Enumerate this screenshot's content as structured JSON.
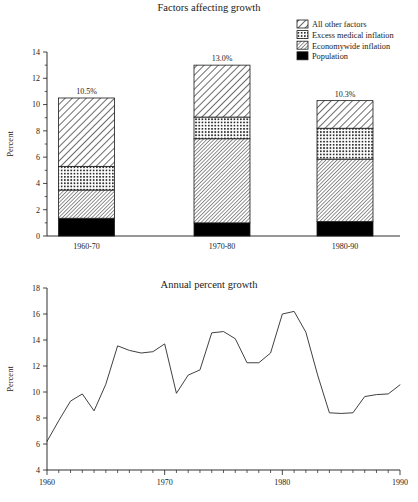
{
  "chart_data": [
    {
      "type": "bar",
      "id": "factors-affecting-growth",
      "title": "Factors affecting growth",
      "xlabel": "",
      "ylabel": "Percent",
      "ylim": [
        0,
        14
      ],
      "yticks": [
        0,
        2,
        4,
        6,
        8,
        10,
        12,
        14
      ],
      "yticklabels": [
        "0",
        "2",
        "4",
        "6",
        "8",
        "10",
        "12",
        "14"
      ],
      "minor_yticks": [
        1,
        3,
        5,
        7,
        9,
        11,
        13
      ],
      "grid": false,
      "stacked": true,
      "legend_position": "top-right",
      "categories": [
        "1960-70",
        "1970-80",
        "1980-90"
      ],
      "totals": [
        10.5,
        13.0,
        10.3
      ],
      "total_labels": [
        "10.5%",
        "13.0%",
        "10.3%"
      ],
      "series": [
        {
          "name": "Population",
          "pattern": "solid-black",
          "values": [
            1.35,
            1.0,
            1.1
          ]
        },
        {
          "name": "Economywide inflation",
          "pattern": "diagonal-fine-right",
          "values": [
            2.15,
            6.4,
            4.75
          ]
        },
        {
          "name": "Excess medical inflation",
          "pattern": "crosshatch-grid",
          "values": [
            1.8,
            1.65,
            2.35
          ]
        },
        {
          "name": "All other factors",
          "pattern": "diagonal-coarse-right",
          "values": [
            5.2,
            3.95,
            2.1
          ]
        }
      ],
      "legend_order": [
        "All other factors",
        "Excess medical inflation",
        "Economywide inflation",
        "Population"
      ]
    },
    {
      "type": "line",
      "id": "annual-percent-growth",
      "title": "Annual percent growth",
      "xlabel": "",
      "ylabel": "Percent",
      "ylim": [
        4,
        18
      ],
      "yticks": [
        4,
        6,
        8,
        10,
        12,
        14,
        16,
        18
      ],
      "yticklabels": [
        "4",
        "6",
        "8",
        "10",
        "12",
        "14",
        "16",
        "18"
      ],
      "xlim": [
        1960,
        1990
      ],
      "xticks": [
        1960,
        1970,
        1980,
        1990
      ],
      "xticklabels": [
        "1960",
        "1970",
        "1980",
        "1990"
      ],
      "minor_xtick_step": 1,
      "grid": false,
      "x": [
        1960,
        1961,
        1962,
        1963,
        1964,
        1965,
        1966,
        1967,
        1968,
        1969,
        1970,
        1971,
        1972,
        1973,
        1974,
        1975,
        1976,
        1977,
        1978,
        1979,
        1980,
        1981,
        1982,
        1983,
        1984,
        1985,
        1986,
        1987,
        1988,
        1989,
        1990
      ],
      "values": [
        6.2,
        7.8,
        9.3,
        9.85,
        8.55,
        10.6,
        13.55,
        13.2,
        13.0,
        13.1,
        13.7,
        9.9,
        11.3,
        11.7,
        14.55,
        14.65,
        14.1,
        12.25,
        12.25,
        13.0,
        16.0,
        16.2,
        14.6,
        11.3,
        8.4,
        8.35,
        8.4,
        9.65,
        9.8,
        9.85,
        10.55
      ]
    }
  ]
}
